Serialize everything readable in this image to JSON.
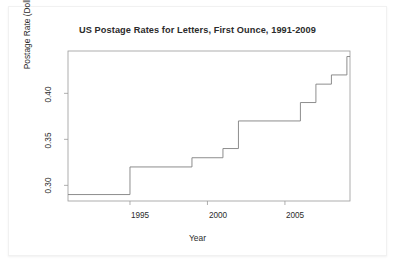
{
  "chart_data": {
    "type": "line",
    "step": "post",
    "title": "US Postage Rates for Letters, First Ounce, 1991-2009",
    "xlabel": "Year",
    "ylabel": "Postage Rate (Dollars)",
    "xlim": [
      1991,
      2009.2
    ],
    "ylim": [
      0.283,
      0.446
    ],
    "grid": false,
    "legend": null,
    "xticks": [
      1995,
      2000,
      2005
    ],
    "xtick_labels": [
      "1995",
      "2000",
      "2005"
    ],
    "yticks": [
      0.3,
      0.35,
      0.4
    ],
    "ytick_labels": [
      "0.30",
      "0.35",
      "0.40"
    ],
    "x": [
      1991,
      1995,
      1999,
      2001,
      2002,
      2006,
      2007,
      2008,
      2009
    ],
    "values": [
      0.29,
      0.32,
      0.33,
      0.34,
      0.37,
      0.39,
      0.41,
      0.42,
      0.44
    ],
    "series": [
      {
        "name": "US first-ounce letter postage rate",
        "x": [
          1991,
          1995,
          1999,
          2001,
          2002,
          2006,
          2007,
          2008,
          2009
        ],
        "values": [
          0.29,
          0.32,
          0.33,
          0.34,
          0.37,
          0.39,
          0.41,
          0.42,
          0.44
        ]
      }
    ],
    "line_color": "#808080",
    "axis_color": "#808080",
    "plot_background": "#ffffff"
  }
}
